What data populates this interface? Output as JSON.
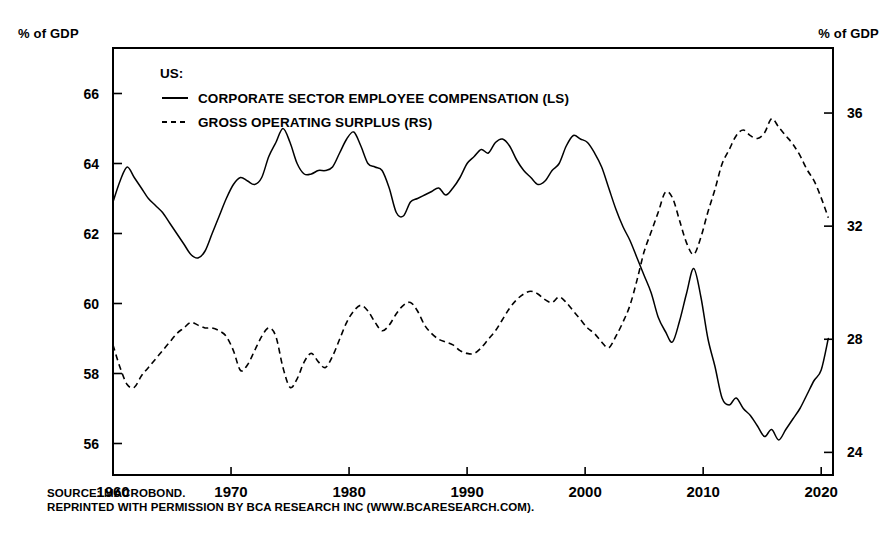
{
  "axis_unit_left": "% of GDP",
  "axis_unit_right": "% of GDP",
  "legend": {
    "title": "US:",
    "items": [
      {
        "label": "CORPORATE SECTOR EMPLOYEE COMPENSATION (LS)",
        "style": "solid"
      },
      {
        "label": "GROSS OPERATING SURPLUS (RS)",
        "style": "dashed"
      }
    ]
  },
  "footer": {
    "line1": "SOURCE: MACROBOND.",
    "line2": "REPRINTED WITH PERMISSION BY BCA RESEARCH INC (WWW.BCARESEARCH.COM)."
  },
  "chart_data": {
    "type": "line",
    "title": "",
    "xlabel": "",
    "ylabel": "% of GDP",
    "grid": false,
    "legend_position": "top-left-inside",
    "xlim": [
      1960,
      2021
    ],
    "xticks": [
      1960,
      1970,
      1980,
      1990,
      2000,
      2010,
      2020
    ],
    "xtick_labels": [
      "1960",
      "1970",
      "1980",
      "1990",
      "2000",
      "2010",
      "2020"
    ],
    "left_axis": {
      "label": "% of GDP",
      "ylim": [
        55.1,
        67.3
      ],
      "yticks": [
        56,
        58,
        60,
        62,
        64,
        66
      ],
      "ytick_labels": [
        "56",
        "58",
        "60",
        "62",
        "64",
        "66"
      ]
    },
    "right_axis": {
      "label": "% of GDP",
      "ylim": [
        23.2,
        38.3
      ],
      "yticks": [
        24,
        28,
        32,
        36
      ],
      "ytick_labels": [
        "24",
        "28",
        "32",
        "36"
      ]
    },
    "series": [
      {
        "name": "CORPORATE SECTOR EMPLOYEE COMPENSATION (LS)",
        "axis": "left",
        "style": "solid",
        "color": "#000000",
        "x": [
          1960.0,
          1960.6,
          1961.2,
          1961.8,
          1962.4,
          1963.0,
          1963.6,
          1964.2,
          1964.8,
          1965.4,
          1966.0,
          1966.6,
          1967.2,
          1967.8,
          1968.4,
          1969.0,
          1969.6,
          1970.2,
          1970.8,
          1971.4,
          1972.0,
          1972.6,
          1973.2,
          1973.8,
          1974.4,
          1975.0,
          1975.6,
          1976.2,
          1976.8,
          1977.4,
          1978.0,
          1978.6,
          1979.2,
          1979.8,
          1980.4,
          1981.0,
          1981.6,
          1982.2,
          1982.8,
          1983.4,
          1984.0,
          1984.6,
          1985.2,
          1985.8,
          1986.4,
          1987.0,
          1987.6,
          1988.2,
          1988.8,
          1989.4,
          1990.0,
          1990.6,
          1991.2,
          1991.8,
          1992.4,
          1993.0,
          1993.6,
          1994.2,
          1994.8,
          1995.4,
          1996.0,
          1996.6,
          1997.2,
          1997.8,
          1998.4,
          1999.0,
          1999.6,
          2000.2,
          2000.8,
          2001.4,
          2002.0,
          2002.6,
          2003.2,
          2003.8,
          2004.4,
          2005.0,
          2005.6,
          2006.2,
          2006.8,
          2007.4,
          2008.0,
          2008.6,
          2009.2,
          2009.8,
          2010.4,
          2011.0,
          2011.6,
          2012.2,
          2012.8,
          2013.4,
          2014.0,
          2014.6,
          2015.2,
          2015.8,
          2016.4,
          2017.0,
          2017.6,
          2018.2,
          2018.8,
          2019.4,
          2020.0,
          2020.6
        ],
        "y": [
          62.9,
          63.5,
          63.9,
          63.6,
          63.3,
          63.0,
          62.8,
          62.6,
          62.3,
          62.0,
          61.7,
          61.4,
          61.3,
          61.5,
          62.0,
          62.5,
          63.0,
          63.4,
          63.6,
          63.5,
          63.4,
          63.6,
          64.2,
          64.6,
          65.0,
          64.6,
          64.0,
          63.7,
          63.7,
          63.8,
          63.8,
          63.9,
          64.3,
          64.7,
          64.9,
          64.5,
          64.0,
          63.9,
          63.8,
          63.3,
          62.6,
          62.5,
          62.9,
          63.0,
          63.1,
          63.2,
          63.3,
          63.1,
          63.3,
          63.6,
          64.0,
          64.2,
          64.4,
          64.3,
          64.6,
          64.7,
          64.5,
          64.1,
          63.8,
          63.6,
          63.4,
          63.5,
          63.8,
          64.0,
          64.5,
          64.8,
          64.7,
          64.6,
          64.3,
          63.9,
          63.3,
          62.7,
          62.2,
          61.8,
          61.3,
          60.8,
          60.3,
          59.6,
          59.2,
          58.9,
          59.5,
          60.3,
          61.0,
          60.2,
          59.0,
          58.2,
          57.3,
          57.1,
          57.3,
          57.0,
          56.8,
          56.5,
          56.2,
          56.4,
          56.1,
          56.4,
          56.7,
          57.0,
          57.4,
          57.8,
          58.1,
          59.0
        ]
      },
      {
        "name": "GROSS OPERATING SURPLUS (RS)",
        "axis": "right",
        "style": "dashed",
        "color": "#000000",
        "x": [
          1960.0,
          1960.6,
          1961.2,
          1961.8,
          1962.4,
          1963.0,
          1963.6,
          1964.2,
          1964.8,
          1965.4,
          1966.0,
          1966.6,
          1967.2,
          1967.8,
          1968.4,
          1969.0,
          1969.6,
          1970.2,
          1970.8,
          1971.4,
          1972.0,
          1972.6,
          1973.2,
          1973.8,
          1974.4,
          1975.0,
          1975.6,
          1976.2,
          1976.8,
          1977.4,
          1978.0,
          1978.6,
          1979.2,
          1979.8,
          1980.4,
          1981.0,
          1981.6,
          1982.2,
          1982.8,
          1983.4,
          1984.0,
          1984.6,
          1985.2,
          1985.8,
          1986.4,
          1987.0,
          1987.6,
          1988.2,
          1988.8,
          1989.4,
          1990.0,
          1990.6,
          1991.2,
          1991.8,
          1992.4,
          1993.0,
          1993.6,
          1994.2,
          1994.8,
          1995.4,
          1996.0,
          1996.6,
          1997.2,
          1997.8,
          1998.4,
          1999.0,
          1999.6,
          2000.2,
          2000.8,
          2001.4,
          2002.0,
          2002.6,
          2003.2,
          2003.8,
          2004.4,
          2005.0,
          2005.6,
          2006.2,
          2006.8,
          2007.4,
          2008.0,
          2008.6,
          2009.2,
          2009.8,
          2010.4,
          2011.0,
          2011.6,
          2012.2,
          2012.8,
          2013.4,
          2014.0,
          2014.6,
          2015.2,
          2015.8,
          2016.4,
          2017.0,
          2017.6,
          2018.2,
          2018.8,
          2019.4,
          2020.0,
          2020.6
        ],
        "y": [
          27.8,
          27.0,
          26.4,
          26.3,
          26.7,
          27.0,
          27.3,
          27.6,
          27.9,
          28.2,
          28.4,
          28.6,
          28.5,
          28.4,
          28.4,
          28.3,
          28.1,
          27.6,
          26.9,
          27.1,
          27.6,
          28.1,
          28.4,
          28.1,
          27.0,
          26.3,
          26.6,
          27.2,
          27.5,
          27.2,
          27.0,
          27.4,
          28.0,
          28.6,
          29.0,
          29.2,
          29.0,
          28.6,
          28.3,
          28.5,
          28.9,
          29.2,
          29.3,
          29.0,
          28.5,
          28.2,
          28.0,
          27.9,
          27.8,
          27.6,
          27.5,
          27.5,
          27.7,
          28.0,
          28.3,
          28.7,
          29.1,
          29.4,
          29.6,
          29.7,
          29.6,
          29.4,
          29.3,
          29.5,
          29.3,
          29.0,
          28.7,
          28.4,
          28.2,
          27.9,
          27.7,
          28.1,
          28.6,
          29.2,
          30.1,
          31.1,
          31.8,
          32.5,
          33.2,
          33.0,
          32.2,
          31.4,
          31.0,
          31.6,
          32.5,
          33.3,
          34.2,
          34.7,
          35.2,
          35.4,
          35.2,
          35.1,
          35.3,
          35.8,
          35.5,
          35.2,
          34.9,
          34.5,
          34.0,
          33.6,
          33.0,
          32.3
        ]
      }
    ]
  }
}
